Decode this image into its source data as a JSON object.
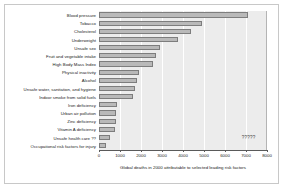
{
  "chart_data": {
    "type": "bar",
    "orientation": "horizontal",
    "title": "",
    "xlabel": "Global deaths in 2000 attributable to selected leading risk factors",
    "ylabel": "",
    "xlim": [
      0,
      8000
    ],
    "xticks": [
      "0",
      "1000",
      "2000",
      "3000",
      "4000",
      "5000",
      "6000",
      "7000",
      "8000"
    ],
    "grid": true,
    "legend": "none",
    "categories": [
      "Blood pressure",
      "Tobacco",
      "Cholesterol",
      "Underweight",
      "Unsafe sex",
      "Fruit and vegetable intake",
      "High Body Mass Index",
      "Physical inactivity",
      "Alcohol",
      "Unsafe water, sanitation, and hygiene",
      "Indoor smoke from solid fuels",
      "Iron deficiency",
      "Urban air pollution",
      "Zinc deficiency",
      "Vitamin A deficiency",
      "Unsafe health care ??",
      "Occupational risk factors for injury"
    ],
    "values": [
      7100,
      4900,
      4400,
      3750,
      2900,
      2700,
      2580,
      1920,
      1800,
      1730,
      1620,
      840,
      800,
      790,
      780,
      500,
      310
    ],
    "annotations": [
      {
        "text": "?????",
        "x": 6800,
        "y_index": 15
      }
    ],
    "bar_fill": "#b9b9b9",
    "bar_edge": "#7d7d7d",
    "plot_background": "#ececec",
    "grid_color": "#ffffff",
    "frame_color": "#c8c8c8"
  }
}
